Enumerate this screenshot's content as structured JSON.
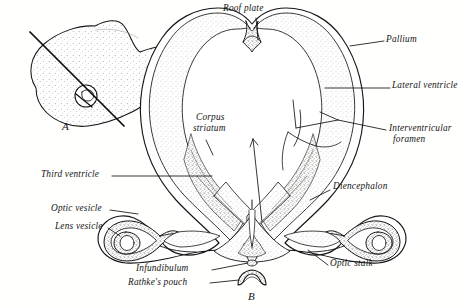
{
  "figure": {
    "type": "anatomical-line-drawing",
    "panels": [
      {
        "id": "A",
        "letter": "A",
        "caption": "A",
        "description": "small embryo head profile with plane-of-section line"
      },
      {
        "id": "B",
        "letter": "B",
        "caption": "B",
        "description": "transverse section of forebrain showing telencephalic vesicles"
      }
    ]
  },
  "labels": {
    "roof_plate": "Roof plate",
    "pallium": "Pallium",
    "lateral_ventricle": "Lateral ventricle",
    "interventricular_foramen_line1": "Interventricular",
    "interventricular_foramen_line2": "foramen",
    "corpus_striatum_line1": "Corpus",
    "corpus_striatum_line2": "striatum",
    "third_ventricle": "Third ventricle",
    "diencephalon": "Diencephalon",
    "optic_vesicle": "Optic vesicle",
    "lens_vesicle": "Lens vesicle",
    "optic_stalk": "Optic stalk",
    "infundibulum": "Infundibulum",
    "rathkes_pouch": "Rathke's pouch",
    "panel_a": "A",
    "panel_b": "B"
  },
  "colors": {
    "ink": "#161616",
    "background": "#fffffe",
    "tissue_light": "#b9b4ae",
    "tissue_mid": "#8f8982",
    "tissue_dark": "#5d5852"
  }
}
